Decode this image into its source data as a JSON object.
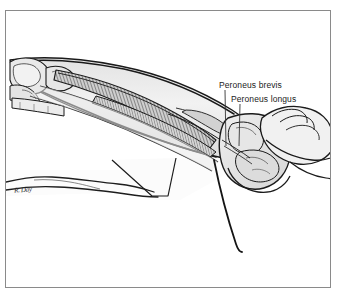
{
  "figure": {
    "kind": "medical-anatomical-illustration",
    "view": "lateral",
    "style": "grayscale pen-and-ink line drawing with gray tonal fills",
    "frame": {
      "border_color": "#8a8a8a",
      "background_color": "#ffffff",
      "page_background": "#ffffff"
    },
    "palette": {
      "outline": "#1a1a1a",
      "skin_fill": "#efefef",
      "muscle_fill": "#d8d8d8",
      "muscle_shadow": "#9a9a9a",
      "bone_fill": "#e4e4e4",
      "tendon_fill": "#f2f2f2",
      "hatching": "#4a4a4a",
      "drape_fill": "#fbfbfb",
      "label_text": "#1b1b1b",
      "leader_line": "#333333"
    }
  },
  "labels": [
    {
      "id": "peroneus-brevis",
      "text": "Peroneus brevis",
      "leader": {
        "from_x": 225,
        "from_y": 90,
        "to_x": 226,
        "to_y": 146
      }
    },
    {
      "id": "peroneus-longus",
      "text": "Peroneus longus",
      "leader": {
        "from_x": 240,
        "from_y": 104,
        "to_x": 239,
        "to_y": 146
      }
    }
  ],
  "signature": {
    "text": "R. Day",
    "legible": false
  },
  "anatomy_parts": [
    {
      "name": "knee-joint",
      "description": "femoral condyles and proximal tibiofibular joint at upper left"
    },
    {
      "name": "fibula",
      "description": "lateral long bone running down the leg"
    },
    {
      "name": "tibia",
      "description": "medial long bone of the leg"
    },
    {
      "name": "peroneus-longus-muscle",
      "description": "superficial lateral compartment muscle belly with hatched striations"
    },
    {
      "name": "peroneus-brevis-muscle",
      "description": "deeper lateral compartment muscle belly"
    },
    {
      "name": "peroneal-tendons",
      "description": "tendons passing posterior to the lateral malleolus"
    },
    {
      "name": "lateral-malleolus",
      "description": "distal fibular prominence at the ankle"
    },
    {
      "name": "foot",
      "description": "foot shown in plantarflexion at right"
    },
    {
      "name": "examiner-hand",
      "description": "hand grasping the forefoot from the right"
    },
    {
      "name": "contralateral-limb",
      "description": "opposite leg outline in lower left"
    },
    {
      "name": "surgical-drape",
      "description": "draped sheet beneath the limb"
    }
  ]
}
